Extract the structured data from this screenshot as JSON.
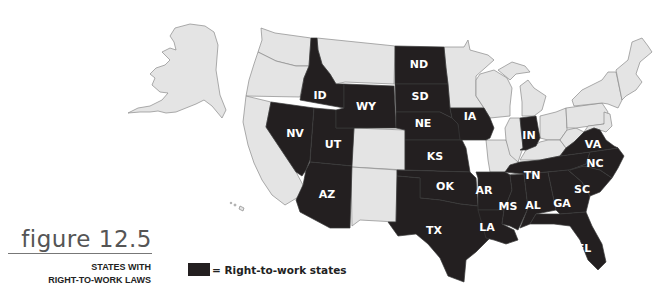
{
  "figure": {
    "number_label": "figure 12.5",
    "caption_line1": "STATES WITH",
    "caption_line2": "RIGHT-TO-WORK LAWS"
  },
  "legend": {
    "swatch_color": "#231f20",
    "label": "= Right-to-work states"
  },
  "map": {
    "colors": {
      "right_to_work": "#231f20",
      "other": "#e4e4e4",
      "border": "#8a8a8a"
    },
    "right_to_work_states": [
      "ID",
      "NV",
      "UT",
      "AZ",
      "WY",
      "ND",
      "SD",
      "NE",
      "KS",
      "OK",
      "TX",
      "IA",
      "AR",
      "LA",
      "MS",
      "AL",
      "TN",
      "GA",
      "FL",
      "SC",
      "NC",
      "VA",
      "IN"
    ],
    "labels": {
      "ND": "ND",
      "SD": "SD",
      "NE": "NE",
      "KS": "KS",
      "OK": "OK",
      "TX": "TX",
      "ID": "ID",
      "WY": "WY",
      "NV": "NV",
      "UT": "UT",
      "AZ": "AZ",
      "IA": "IA",
      "IN": "IN",
      "VA": "VA",
      "NC": "NC",
      "TN": "TN",
      "AR": "AR",
      "SC": "SC",
      "MS": "MS",
      "AL": "AL",
      "GA": "GA",
      "LA": "LA",
      "FL": "FL"
    }
  }
}
